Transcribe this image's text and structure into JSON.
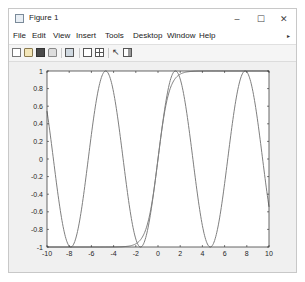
{
  "window": {
    "title": "Figure 1",
    "controls": {
      "minimize": "–",
      "maximize": "☐",
      "close": "✕"
    }
  },
  "menu": {
    "items": [
      "File",
      "Edit",
      "View",
      "Insert",
      "Tools",
      "Desktop",
      "Window",
      "Help"
    ],
    "overflow": "▸"
  },
  "toolbar": {
    "icons": [
      "new-figure-icon",
      "open-file-icon",
      "save-icon",
      "print-icon",
      "print-preview-icon",
      "link-plot-icon",
      "insert-legend-icon",
      "edit-plot-arrow-icon",
      "property-inspector-icon"
    ]
  },
  "colors": {
    "line": "#7f7f7f",
    "axis": "#262626",
    "figure_bg": "#f0f0f0"
  },
  "chart_data": {
    "type": "line",
    "title": "",
    "xlabel": "",
    "ylabel": "",
    "xlim": [
      -10,
      10
    ],
    "ylim": [
      -1,
      1
    ],
    "grid": false,
    "legend": null,
    "xticks": [
      -10,
      -8,
      -6,
      -4,
      -2,
      0,
      2,
      4,
      6,
      8,
      10
    ],
    "yticks": [
      -1,
      -0.8,
      -0.6,
      -0.4,
      -0.2,
      0,
      0.2,
      0.4,
      0.6,
      0.8,
      1
    ],
    "xtick_labels": [
      "-10",
      "-8",
      "-6",
      "-4",
      "-2",
      "0",
      "2",
      "4",
      "6",
      "8",
      "10"
    ],
    "ytick_labels": [
      "-1",
      "-0.8",
      "-0.6",
      "-0.4",
      "-0.2",
      "0",
      "0.2",
      "0.4",
      "0.6",
      "0.8",
      "1"
    ],
    "series": [
      {
        "name": "sin(x)",
        "x": [
          -10,
          -9,
          -8,
          -7.854,
          -7,
          -6,
          -5,
          -4.712,
          -4,
          -3,
          -2,
          -1.571,
          -1,
          0,
          1,
          1.571,
          2,
          3,
          4,
          4.712,
          5,
          6,
          7,
          7.854,
          8,
          9,
          10
        ],
        "y": [
          0.544,
          -0.412,
          -0.989,
          -1.0,
          -0.657,
          0.279,
          0.959,
          1.0,
          0.757,
          -0.141,
          -0.909,
          -1.0,
          -0.841,
          0.0,
          0.841,
          1.0,
          0.909,
          0.141,
          -0.757,
          -1.0,
          -0.959,
          -0.279,
          0.657,
          1.0,
          0.989,
          0.412,
          -0.544
        ]
      },
      {
        "name": "tanh(x)",
        "x": [
          -10,
          -8,
          -6,
          -5,
          -4,
          -3,
          -2.5,
          -2,
          -1.5,
          -1,
          -0.5,
          0,
          0.5,
          1,
          1.5,
          2,
          2.5,
          3,
          4,
          5,
          6,
          8,
          10
        ],
        "y": [
          -1.0,
          -1.0,
          -1.0,
          -0.9999,
          -0.9993,
          -0.995,
          -0.987,
          -0.964,
          -0.905,
          -0.762,
          -0.462,
          0.0,
          0.462,
          0.762,
          0.905,
          0.964,
          0.987,
          0.995,
          0.9993,
          0.9999,
          1.0,
          1.0,
          1.0
        ]
      }
    ]
  }
}
